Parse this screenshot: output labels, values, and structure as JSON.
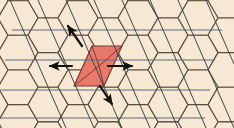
{
  "figure": {
    "width": 234,
    "height": 128,
    "background_color": "#ffffff"
  },
  "colors": {
    "hexagon_fill": "#f6e8d2",
    "hexagon_stroke": "#5a4d3c",
    "highlight_fill": "#e8786a",
    "highlight_stroke": "#7a3a30",
    "grid_line_color": "#5c6a7a",
    "diagonal_line_color": "#3c4450",
    "arrow_color": "#111111"
  },
  "lattice": {
    "type": "hexagonal-honeycomb",
    "orientation": "flat-top",
    "hex_radius": 20,
    "columns": 8,
    "rows": 4,
    "origin_x": 18,
    "origin_y": 18,
    "fill": "#f6e8d2",
    "stroke": "#5a4d3c",
    "stroke_width": 1.1
  },
  "highlight": {
    "label": "highlighted-cell",
    "shape": "rhombus",
    "fill": "#e8786a",
    "stroke": "#7a3a30",
    "points": "92,46 122,46 104,86 74,86",
    "interior_divider": [
      "92,46 99,66 122,46",
      "99,66 104,86",
      "99,66 74,86"
    ]
  },
  "grid_overlay": {
    "horizontal_lines": [
      {
        "name": "h-line-1",
        "x1": 12,
        "y1": 30,
        "x2": 222,
        "y2": 30
      },
      {
        "name": "h-line-2",
        "x1": 5,
        "y1": 60,
        "x2": 215,
        "y2": 60
      },
      {
        "name": "h-line-3",
        "x1": 0,
        "y1": 90,
        "x2": 210,
        "y2": 90
      },
      {
        "name": "h-line-4",
        "x1": 0,
        "y1": 118,
        "x2": 205,
        "y2": 118
      }
    ],
    "diagonal_lines": [
      {
        "name": "d-line-1",
        "x1": 10,
        "y1": 0,
        "x2": 66,
        "y2": 128
      },
      {
        "name": "d-line-2",
        "x1": 38,
        "y1": 0,
        "x2": 94,
        "y2": 128
      },
      {
        "name": "d-line-3",
        "x1": 66,
        "y1": 0,
        "x2": 122,
        "y2": 128
      },
      {
        "name": "d-line-4",
        "x1": 94,
        "y1": 0,
        "x2": 150,
        "y2": 128
      },
      {
        "name": "d-line-5",
        "x1": 122,
        "y1": 0,
        "x2": 178,
        "y2": 128
      },
      {
        "name": "d-line-6",
        "x1": 150,
        "y1": 0,
        "x2": 206,
        "y2": 128
      },
      {
        "name": "d-line-7",
        "x1": 178,
        "y1": 0,
        "x2": 234,
        "y2": 128
      },
      {
        "name": "d-line-8",
        "x1": 206,
        "y1": 0,
        "x2": 234,
        "y2": 64
      }
    ],
    "line_color": "#5c6a7a",
    "line_width": 1
  },
  "arrows": [
    {
      "name": "arrow-northwest",
      "direction": "up-left",
      "x1": 82,
      "y1": 46,
      "x2": 68,
      "y2": 26,
      "color": "#111111"
    },
    {
      "name": "arrow-west",
      "direction": "left",
      "x1": 72,
      "y1": 66,
      "x2": 50,
      "y2": 66,
      "color": "#111111"
    },
    {
      "name": "arrow-east",
      "direction": "right",
      "x1": 108,
      "y1": 66,
      "x2": 132,
      "y2": 66,
      "color": "#111111"
    },
    {
      "name": "arrow-southeast",
      "direction": "down-right",
      "x1": 100,
      "y1": 86,
      "x2": 112,
      "y2": 104,
      "color": "#111111"
    }
  ]
}
